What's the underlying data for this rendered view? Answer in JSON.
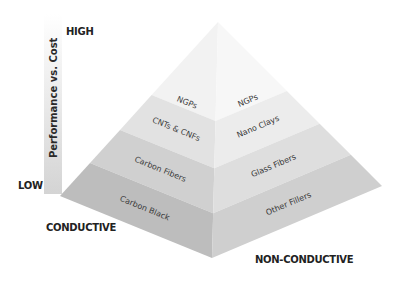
{
  "axis": {
    "title": "Performance vs. Cost",
    "high": "HIGH",
    "low": "LOW",
    "left_side": "CONDUCTIVE",
    "right_side": "NON-CONDUCTIVE"
  },
  "layers": [
    {
      "level": 1,
      "left": "NGPs",
      "right": "NGPs",
      "left_color": "#f2f2f2",
      "right_color": "#f7f7f7"
    },
    {
      "level": 2,
      "left": "CNTs & CNFs",
      "right": "Nano Clays",
      "left_color": "#e2e2e2",
      "right_color": "#ececec"
    },
    {
      "level": 3,
      "left": "Carbon Fibers",
      "right": "Glass Fibers",
      "left_color": "#d0d0d0",
      "right_color": "#dedede"
    },
    {
      "level": 4,
      "left": "Carbon Black",
      "right": "Other Fillers",
      "left_color": "#bdbdbd",
      "right_color": "#cfcfcf"
    }
  ],
  "colors": {
    "axis_bar_top": "#ffffff",
    "axis_bar_bottom": "#d6d6d6",
    "text": "#222222"
  }
}
